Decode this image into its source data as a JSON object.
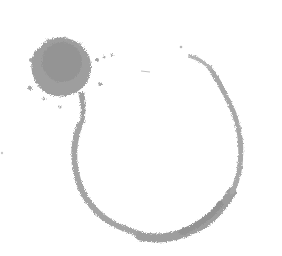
{
  "image": {
    "description": "Grayscale ink stain illustration: splatter blob with a broken circular ring",
    "width": 282,
    "height": 256,
    "background": "#ffffff",
    "colors": {
      "blob": "#9a9a9a",
      "blob_dark": "#8a8a8a",
      "ring": "#a8a8a8",
      "ring_dark": "#959595",
      "speck": "#b5b5b5"
    }
  }
}
